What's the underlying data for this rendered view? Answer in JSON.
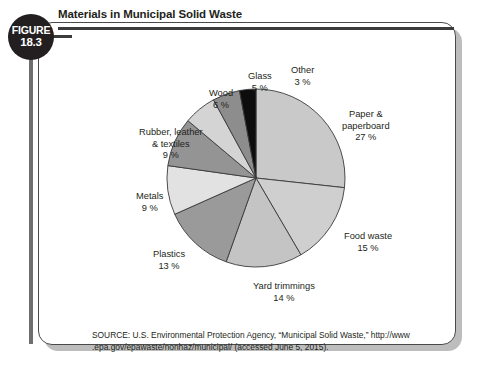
{
  "figure": {
    "badge_word": "FIGURE",
    "badge_number": "18.3",
    "title": "Materials in Municipal Solid Waste"
  },
  "source": {
    "line1": "SOURCE: U.S. Environmental Protection Agency, “Municipal Solid Waste,” http://www",
    "line2": ".epa.gov/epawaste/nonhaz/municipal/ (accessed June 5, 2015)."
  },
  "chart_data": {
    "type": "pie",
    "title": "Materials in Municipal Solid Waste",
    "unit": "percent",
    "start_angle_deg": 0,
    "direction": "clockwise",
    "categories": [
      "Paper & paperboard",
      "Food waste",
      "Yard trimmings",
      "Plastics",
      "Metals",
      "Rubber, leather & textiles",
      "Wood",
      "Glass",
      "Other"
    ],
    "values": [
      27,
      15,
      14,
      13,
      9,
      9,
      6,
      5,
      3
    ],
    "slices": [
      {
        "label": "Paper &\npaperboard\n27 %",
        "name": "Paper & paperboard",
        "value": 27,
        "color": "#c9c9c9",
        "label_x": 303,
        "label_y": 86,
        "side": "right"
      },
      {
        "label": "Food waste\n15 %",
        "name": "Food waste",
        "value": 15,
        "color": "#cfcfcf",
        "label_x": 305,
        "label_y": 208,
        "side": "right"
      },
      {
        "label": "Yard trimmings\n14 %",
        "name": "Yard trimmings",
        "value": 14,
        "color": "#c4c4c4",
        "label_x": 214,
        "label_y": 258,
        "side": "right"
      },
      {
        "label": "Plastics\n13 %",
        "name": "Plastics",
        "value": 13,
        "color": "#9a9a9a",
        "label_x": 114,
        "label_y": 226,
        "side": "left"
      },
      {
        "label": "Metals\n9 %",
        "name": "Metals",
        "value": 9,
        "color": "#e2e2e2",
        "label_x": 97,
        "label_y": 168,
        "side": "left"
      },
      {
        "label": "Rubber, leather\n& textiles\n9 %",
        "name": "Rubber, leather & textiles",
        "value": 9,
        "color": "#949494",
        "label_x": 100,
        "label_y": 104,
        "side": "left"
      },
      {
        "label": "Wood\n6 %",
        "name": "Wood",
        "value": 6,
        "color": "#d4d4d4",
        "label_x": 170,
        "label_y": 65,
        "side": "left"
      },
      {
        "label": "Glass\n5 %",
        "name": "Glass",
        "value": 5,
        "color": "#8d8d8d",
        "label_x": 209,
        "label_y": 48,
        "side": "left"
      },
      {
        "label": "Other\n3 %",
        "name": "Other",
        "value": 3,
        "color": "#0d0d0d",
        "label_x": 252,
        "label_y": 42,
        "side": "right"
      }
    ],
    "geometry": {
      "cx": 217,
      "cy": 155,
      "r": 89
    },
    "stroke": "#3a3a3a",
    "legend": "none",
    "grid": false
  }
}
